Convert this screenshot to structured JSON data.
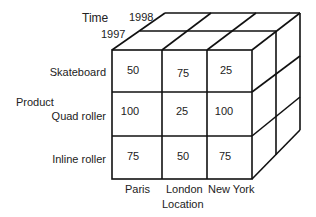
{
  "diagram": {
    "type": "data-cube",
    "axes": {
      "time": {
        "label": "Time",
        "values": [
          "1997",
          "1998"
        ]
      },
      "product": {
        "label": "Product",
        "values": [
          "Skateboard",
          "Quad roller",
          "Inline roller"
        ]
      },
      "location": {
        "label": "Location",
        "values": [
          "Paris",
          "London",
          "New York"
        ]
      }
    },
    "front_face": {
      "time": "1997",
      "rows": [
        {
          "product": "Skateboard",
          "values": [
            "50",
            "75",
            "25"
          ]
        },
        {
          "product": "Quad roller",
          "values": [
            "100",
            "25",
            "100"
          ]
        },
        {
          "product": "Inline roller",
          "values": [
            "75",
            "50",
            "75"
          ]
        }
      ]
    },
    "line_color": "#111111"
  }
}
